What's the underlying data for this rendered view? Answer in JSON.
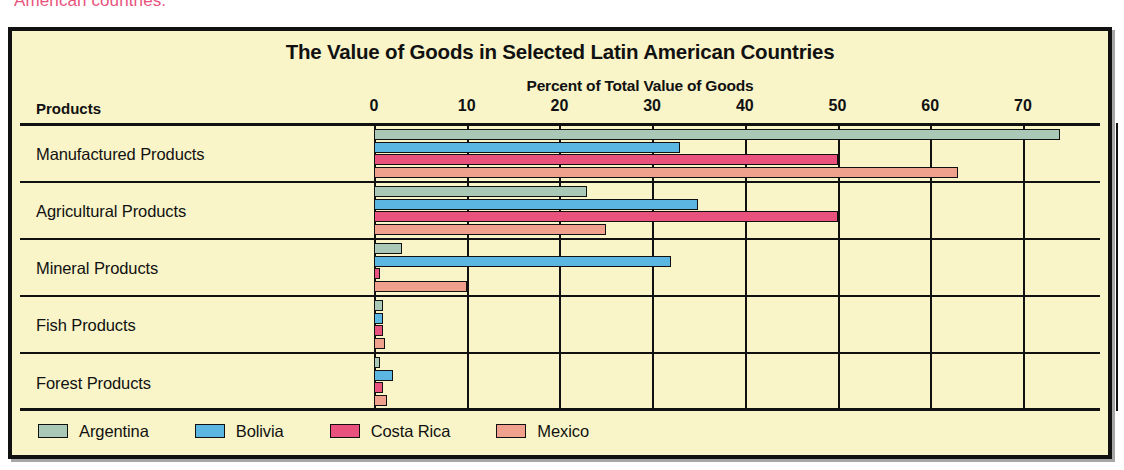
{
  "caption_fragment": "American countries.",
  "chart_data": {
    "type": "bar",
    "orientation": "horizontal",
    "title": "The Value of Goods in Selected Latin American Countries",
    "xlabel": "Percent of Total Value of Goods",
    "ylabel": "Products",
    "row_header": "Products",
    "xlim": [
      0,
      80
    ],
    "xticks": [
      0,
      10,
      20,
      30,
      40,
      50,
      60,
      70
    ],
    "xtick_labels": [
      "0",
      "10",
      "20",
      "30",
      "40",
      "50",
      "60",
      "70"
    ],
    "grid": true,
    "legend_position": "bottom-left",
    "categories": [
      "Manufactured Products",
      "Agricultural Products",
      "Mineral Products",
      "Fish Products",
      "Forest Products"
    ],
    "series": [
      {
        "name": "Argentina",
        "color": "#a9c9b6",
        "values": [
          74,
          23,
          3,
          1,
          0.6
        ]
      },
      {
        "name": "Bolivia",
        "color": "#5cb6e2",
        "values": [
          33,
          35,
          32,
          1,
          2
        ]
      },
      {
        "name": "Costa Rica",
        "color": "#e8527d",
        "values": [
          50,
          50,
          0.7,
          1,
          1
        ]
      },
      {
        "name": "Mexico",
        "color": "#f0a18d",
        "values": [
          63,
          25,
          10,
          1.2,
          1.4
        ]
      }
    ]
  },
  "colors": {
    "background": "#f9f5c9",
    "border": "#111111",
    "caption": "#e8547c",
    "argentina": "#a9c9b6",
    "bolivia": "#5cb6e2",
    "costa_rica": "#e8527d",
    "mexico": "#f0a18d"
  }
}
